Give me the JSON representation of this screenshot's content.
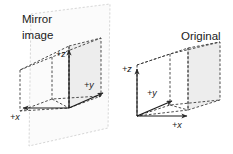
{
  "figure": {
    "type": "diagram",
    "background_color": "#ffffff",
    "line_color": "#2b2b2b",
    "mirror_plane_color": "#c9c9c9",
    "shaded_face_color": "#ededed",
    "panels": {
      "mirror": {
        "title": "Mirror\nimage",
        "title_line_1": "Mirror",
        "title_line_2": "image",
        "axes": [
          {
            "id": "x",
            "label": "+x"
          },
          {
            "id": "y",
            "label": "+y"
          },
          {
            "id": "z",
            "label": "+z"
          }
        ]
      },
      "original": {
        "title": "Original",
        "axes": [
          {
            "id": "z",
            "label": "+z"
          },
          {
            "id": "y",
            "label": "+y"
          },
          {
            "id": "x",
            "label": "+x"
          }
        ]
      }
    }
  }
}
